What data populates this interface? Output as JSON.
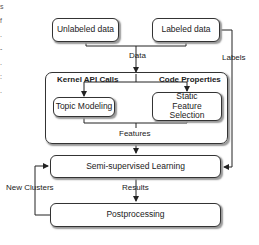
{
  "nodes": {
    "unlabeled": "Unlabeled data",
    "labeled": "Labeled data",
    "topic_modeling": "Topic Modeling",
    "static_feature": "Static Feature Selection",
    "ssl": "Semi-supervised Learning",
    "postprocessing": "Postprocessing"
  },
  "group": {
    "kernel_api": "Kernel API Calls",
    "code_properties": "Code Properties"
  },
  "edges": {
    "data": "Data",
    "labels": "Labels",
    "features": "Features",
    "results": "Results",
    "new_clusters": "New Clusters"
  },
  "edge_text_fragments": "s f . - . : ."
}
